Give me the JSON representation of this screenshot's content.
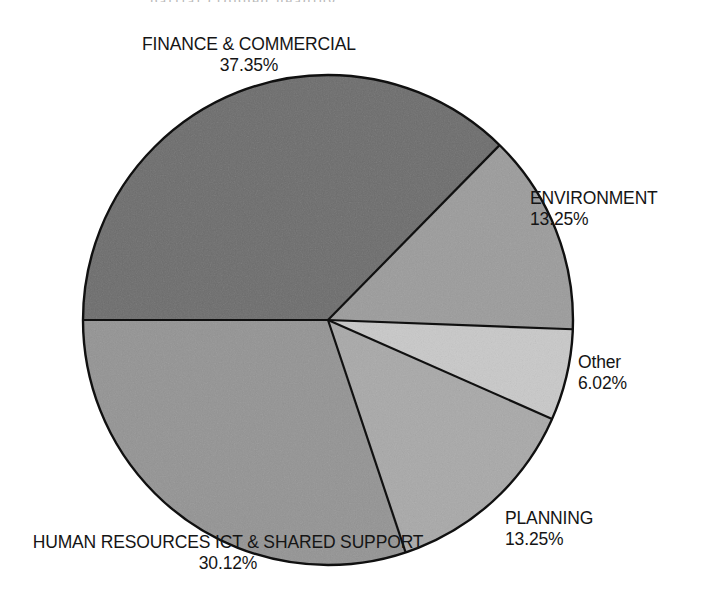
{
  "figure": {
    "background_color": "#ffffff",
    "outline_color": "#101010",
    "top_crop_remnant": "partial cropped heading"
  },
  "chart_data": {
    "type": "pie",
    "title": "",
    "subtitle": "",
    "xlabel": "",
    "ylabel": "",
    "grid": false,
    "legend_position": "none",
    "label_style": "outside-callout",
    "value_format": "percent-2dp",
    "total_percent": 99.99,
    "center": {
      "x": 328,
      "y": 320
    },
    "radius": 245,
    "start_angle_deg": 180,
    "direction": "counterclockwise",
    "categories": [
      "FINANCE & COMMERCIAL",
      "ENVIRONMENT",
      "Other",
      "PLANNING",
      "HUMAN RESOURCES ICT & SHARED SUPPORT"
    ],
    "values": [
      37.35,
      13.25,
      6.02,
      13.25,
      30.12
    ],
    "slices": [
      {
        "name": "FINANCE & COMMERCIAL",
        "label": "FINANCE & COMMERCIAL",
        "percent": 37.35,
        "percent_text": "37.35%",
        "color": "#6d6d6d",
        "start_angle_deg": 180.0,
        "end_angle_deg": 45.54,
        "label_position": "top"
      },
      {
        "name": "ENVIRONMENT",
        "label": "ENVIRONMENT",
        "percent": 13.25,
        "percent_text": "13.25%",
        "color": "#9c9c9c",
        "start_angle_deg": 45.54,
        "end_angle_deg": 0.84,
        "label_position": "right"
      },
      {
        "name": "Other",
        "label": "Other",
        "percent": 6.02,
        "percent_text": "6.02%",
        "color": "#c9c9c9",
        "start_angle_deg": 0.84,
        "end_angle_deg": -20.83,
        "label_position": "right-lower"
      },
      {
        "name": "PLANNING",
        "label": "PLANNING",
        "percent": 13.25,
        "percent_text": "13.25%",
        "color": "#a9a9a9",
        "start_angle_deg": -20.83,
        "end_angle_deg": -68.53,
        "label_position": "bottom-right"
      },
      {
        "name": "HUMAN RESOURCES ICT & SHARED SUPPORT",
        "label": "HUMAN RESOURCES ICT & SHARED SUPPORT",
        "percent": 30.12,
        "percent_text": "30.12%",
        "color": "#949494",
        "start_angle_deg": -68.53,
        "end_angle_deg": -180.0,
        "label_position": "bottom-left"
      }
    ]
  }
}
